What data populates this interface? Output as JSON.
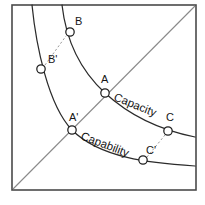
{
  "figure": {
    "background_color": "#ffffff",
    "frame_color": "#4a4a4a",
    "diagonal_color": "#8a8a8a",
    "curve_color": "#2b2b2b",
    "connector_color": "#9a9a9a",
    "node_fill_color": "#ffffff",
    "node_stroke_color": "#1f1f1f"
  },
  "frame": {
    "x": 12,
    "y": 5,
    "width": 184,
    "height": 185
  },
  "diagonal": {
    "name": "diagonal-reference-line",
    "from_x": 13,
    "from_y": 189,
    "to_x": 195,
    "to_y": 6
  },
  "curves": [
    {
      "id": "capacity",
      "label": "Capacity",
      "label_x": 113,
      "label_y": 100,
      "label_rotation": 22,
      "path": "M 62 5 C 66 40, 80 70, 105 93 C 130 116, 160 130, 195 137"
    },
    {
      "id": "capability",
      "label": "Capability",
      "label_x": 80,
      "label_y": 139,
      "label_rotation": 21,
      "path": "M 32 5 C 36 45, 48 105, 72 130 C 100 158, 150 163, 195 166"
    }
  ],
  "points": [
    {
      "id": "A",
      "label": "A",
      "curve": "capacity",
      "cx": 105,
      "cy": 93,
      "r": 4.2,
      "label_x": 101,
      "label_y": 83
    },
    {
      "id": "A-prime",
      "label": "A'",
      "curve": "capability",
      "cx": 72,
      "cy": 130,
      "r": 4.2,
      "label_x": 69,
      "label_y": 121
    },
    {
      "id": "B",
      "label": "B",
      "curve": "capacity",
      "cx": 70,
      "cy": 32,
      "r": 4.2,
      "label_x": 75,
      "label_y": 25
    },
    {
      "id": "B-prime",
      "label": "B'",
      "curve": "capability",
      "cx": 41,
      "cy": 69,
      "r": 4.2,
      "label_x": 48,
      "label_y": 63
    },
    {
      "id": "C",
      "label": "C",
      "curve": "capacity",
      "cx": 168,
      "cy": 131,
      "r": 4.2,
      "label_x": 166,
      "label_y": 121
    },
    {
      "id": "C-prime",
      "label": "C'",
      "curve": "capability",
      "cx": 143,
      "cy": 160,
      "r": 4.2,
      "label_x": 146,
      "label_y": 154
    }
  ],
  "connectors": [
    {
      "id": "connector-B",
      "from": "B-prime",
      "to": "B",
      "x1": 45,
      "y1": 65,
      "x2": 66,
      "y2": 36
    },
    {
      "id": "connector-C",
      "from": "C-prime",
      "to": "C",
      "x1": 147,
      "y1": 157,
      "x2": 165,
      "y2": 135
    }
  ],
  "chart_data": {
    "type": "line",
    "xlabel": "",
    "ylabel": "",
    "grid": false,
    "legend": "inline-curve-labels",
    "series": [
      {
        "name": "Capacity",
        "description": "Upper-right convex decreasing curve",
        "points": [
          {
            "label": "B",
            "x": 70,
            "y": 32
          },
          {
            "label": "A",
            "x": 105,
            "y": 93
          },
          {
            "label": "C",
            "x": 168,
            "y": 131
          }
        ]
      },
      {
        "name": "Capability",
        "description": "Lower-left convex decreasing curve",
        "points": [
          {
            "label": "B'",
            "x": 41,
            "y": 69
          },
          {
            "label": "A'",
            "x": 72,
            "y": 130
          },
          {
            "label": "C'",
            "x": 143,
            "y": 160
          }
        ]
      }
    ],
    "annotations": [
      {
        "text": "Capacity",
        "on": "Capacity"
      },
      {
        "text": "Capability",
        "on": "Capability"
      }
    ],
    "reference_lines": [
      {
        "name": "diagonal",
        "from": [
          0,
          0
        ],
        "to": [
          1,
          1
        ],
        "style": "solid-thin"
      }
    ],
    "pairings": [
      {
        "upper": "B",
        "lower": "B'",
        "style": "dashed"
      },
      {
        "upper": "A",
        "lower": "A'",
        "style": "none"
      },
      {
        "upper": "C",
        "lower": "C'",
        "style": "dashed"
      }
    ]
  }
}
